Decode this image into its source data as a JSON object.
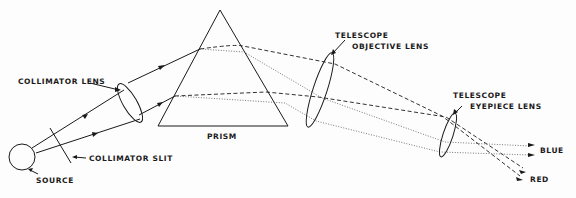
{
  "diagram": {
    "labels": {
      "source": "SOURCE",
      "collimator_slit": "COLLIMATOR SLIT",
      "collimator_lens": "COLLIMATOR LENS",
      "prism": "PRISM",
      "objective_line1": "TELESCOPE",
      "objective_line2": "OBJECTIVE LENS",
      "eyepiece_line1": "TELESCOPE",
      "eyepiece_line2": "EYEPIECE LENS",
      "blue": "BLUE",
      "red": "RED"
    },
    "colors": {
      "ink": "#1a1a1a",
      "background": "#fdfdfd",
      "dotted_ray": "#555555"
    },
    "legend": {
      "dashed_ray": "red light path",
      "dotted_ray": "blue light path"
    }
  }
}
